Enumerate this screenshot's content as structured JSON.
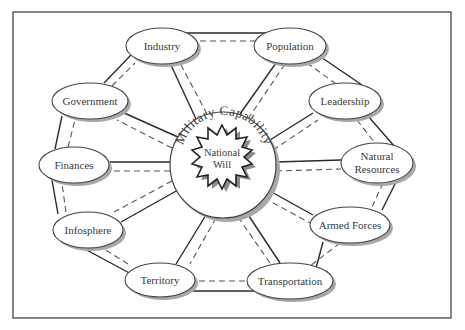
{
  "diagram": {
    "type": "hub-and-spoke",
    "frame": {
      "x": 13,
      "y": 12,
      "width": 438,
      "height": 306
    },
    "center": {
      "outer_label": "Military Capability",
      "inner_label_line1": "National",
      "inner_label_line2": "Will",
      "cx": 223,
      "cy": 165,
      "r": 53
    },
    "nodes": [
      {
        "id": "industry",
        "label": "Industry",
        "cx": 162,
        "cy": 46,
        "rx": 36,
        "ry": 18
      },
      {
        "id": "population",
        "label": "Population",
        "cx": 290,
        "cy": 46,
        "rx": 36,
        "ry": 18
      },
      {
        "id": "leadership",
        "label": "Leadership",
        "cx": 345,
        "cy": 101,
        "rx": 36,
        "ry": 18
      },
      {
        "id": "natural-resources",
        "label1": "Natural",
        "label2": "Resources",
        "cx": 377,
        "cy": 163,
        "rx": 36,
        "ry": 20
      },
      {
        "id": "armed-forces",
        "label": "Armed Forces",
        "cx": 350,
        "cy": 225,
        "rx": 40,
        "ry": 18
      },
      {
        "id": "transportation",
        "label": "Transportation",
        "cx": 290,
        "cy": 281,
        "rx": 43,
        "ry": 18
      },
      {
        "id": "territory",
        "label": "Territory",
        "cx": 160,
        "cy": 280,
        "rx": 35,
        "ry": 17
      },
      {
        "id": "infosphere",
        "label": "Infosphere",
        "cx": 88,
        "cy": 230,
        "rx": 35,
        "ry": 18
      },
      {
        "id": "finances",
        "label": "Finances",
        "cx": 74,
        "cy": 165,
        "rx": 35,
        "ry": 18
      },
      {
        "id": "government",
        "label": "Government",
        "cx": 90,
        "cy": 101,
        "rx": 38,
        "ry": 18
      }
    ],
    "line_style": {
      "solid": "#2a2a2a",
      "dashed": "#555555"
    },
    "shadow_color": "#9a9a9a"
  }
}
